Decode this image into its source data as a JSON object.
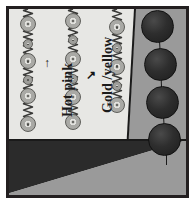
{
  "figure": {
    "background_color": "#ffffff",
    "frame_color": "#231f20"
  },
  "labels": [
    {
      "id": "label-hot-pink",
      "text": "Hot pink",
      "orientation": "vertical-bottom-to-top",
      "pointer_glyph": "↑",
      "pointer_name": "arrow-up-icon"
    },
    {
      "id": "label-gold-yellow",
      "text": "Gold /yellow",
      "orientation": "vertical-bottom-to-top",
      "pointer_glyph": "↗",
      "pointer_name": "arrow-upright-icon"
    }
  ],
  "regions": [
    {
      "id": "region-light-panel",
      "name": "light-panel",
      "color": "#e7e7e4"
    },
    {
      "id": "region-mid-gray",
      "name": "mid-gray-band",
      "color": "#9a9a9a"
    },
    {
      "id": "region-dark-triangle",
      "name": "dark-triangle",
      "color": "#2b2b2b"
    },
    {
      "id": "region-lower-gray",
      "name": "lower-gray-wedge",
      "color": "#9a9a9a"
    }
  ],
  "chains": [
    {
      "id": "chain-1",
      "name": "bead-chain-left",
      "beads": [
        {
          "size": "large",
          "y_pct": 11.5
        },
        {
          "size": "small",
          "y_pct": 27.0
        },
        {
          "size": "large",
          "y_pct": 40.0
        },
        {
          "size": "small",
          "y_pct": 54.0
        },
        {
          "size": "large",
          "y_pct": 66.5
        },
        {
          "size": "large",
          "y_pct": 88.0
        }
      ]
    },
    {
      "id": "chain-2",
      "name": "bead-chain-middle",
      "beads": [
        {
          "size": "large",
          "y_pct": 9.0
        },
        {
          "size": "small",
          "y_pct": 24.0
        },
        {
          "size": "large",
          "y_pct": 38.0
        },
        {
          "size": "small",
          "y_pct": 53.0
        },
        {
          "size": "large",
          "y_pct": 67.0
        },
        {
          "size": "large",
          "y_pct": 86.0
        }
      ]
    },
    {
      "id": "chain-3",
      "name": "bead-chain-right",
      "beads": [
        {
          "size": "large",
          "y_pct": 14.0
        },
        {
          "size": "small",
          "y_pct": 30.0
        },
        {
          "size": "large",
          "y_pct": 44.0
        },
        {
          "size": "small",
          "y_pct": 59.0
        },
        {
          "size": "large",
          "y_pct": 73.0
        }
      ]
    }
  ],
  "spheres": {
    "name": "dark-sphere-column",
    "count": 4,
    "color": "#2e2e2e",
    "items": [
      {
        "y_pct": 9.5,
        "x_pct": 84.0
      },
      {
        "y_pct": 30.0,
        "x_pct": 85.5
      },
      {
        "y_pct": 50.5,
        "x_pct": 86.5
      },
      {
        "y_pct": 70.0,
        "x_pct": 88.0
      }
    ]
  }
}
